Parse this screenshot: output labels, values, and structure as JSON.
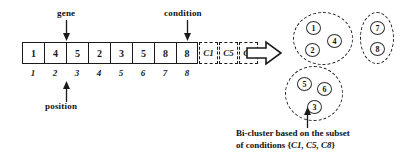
{
  "diagram": {
    "annotations": {
      "gene_label": "gene",
      "condition_label": "condition",
      "position_label": "position"
    },
    "array": {
      "values": [
        "1",
        "4",
        "5",
        "2",
        "3",
        "5",
        "8",
        "8"
      ],
      "positions": [
        "1",
        "2",
        "3",
        "4",
        "5",
        "6",
        "7",
        "8"
      ],
      "conditions": [
        "C1",
        "C5",
        "C8"
      ]
    },
    "transform_arrow": "right-block-arrow",
    "clusters": [
      {
        "name": "cluster-a",
        "shape": "circle",
        "members": [
          {
            "label": "1",
            "x": 12,
            "y": 8
          },
          {
            "label": "4",
            "x": 33,
            "y": 21
          },
          {
            "label": "2",
            "x": 11,
            "y": 30
          }
        ]
      },
      {
        "name": "cluster-b",
        "shape": "oval",
        "members": [
          {
            "label": "7",
            "x": 9,
            "y": 8
          },
          {
            "label": "8",
            "x": 9,
            "y": 29
          }
        ]
      },
      {
        "name": "cluster-c",
        "shape": "circle",
        "members": [
          {
            "label": "5",
            "x": 11,
            "y": 10
          },
          {
            "label": "6",
            "x": 31,
            "y": 15
          },
          {
            "label": "3",
            "x": 21,
            "y": 33
          }
        ]
      }
    ],
    "caption": {
      "line1": "Bi-cluster based on the subset",
      "line2_prefix": "of conditions {",
      "line2_conditions": "C1, C5, C8",
      "line2_suffix": "}"
    },
    "colors": {
      "stroke": "#1a1a1a",
      "background": "#ffffff"
    }
  }
}
